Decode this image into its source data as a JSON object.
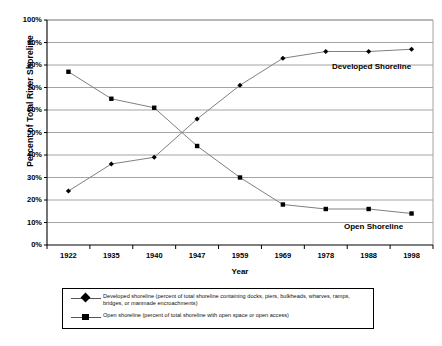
{
  "chart_data": {
    "type": "line",
    "title": "",
    "xlabel": "Year",
    "ylabel": "Percent of Total River Shoreline",
    "categories": [
      "1922",
      "1935",
      "1940",
      "1947",
      "1959",
      "1969",
      "1978",
      "1988",
      "1998"
    ],
    "ylim": [
      0,
      100
    ],
    "ytick_labels": [
      "0%",
      "10%",
      "20%",
      "30%",
      "40%",
      "50%",
      "60%",
      "70%",
      "80%",
      "90%",
      "100%"
    ],
    "ytick_values": [
      0,
      10,
      20,
      30,
      40,
      50,
      60,
      70,
      80,
      90,
      100
    ],
    "grid": "horizontal",
    "legend_position": "bottom",
    "series": [
      {
        "name": "Developed shoreline (percent of total shoreline containing docks, piers, bulkheads, wharves, ramps, bridges, or manmade encroachments)",
        "short_name": "Developed Shoreline",
        "marker": "diamond",
        "color": "#000000",
        "line_color": "#808080",
        "values": [
          24,
          36,
          39,
          56,
          71,
          83,
          86,
          86,
          87
        ]
      },
      {
        "name": "Open shoreline (percent of total shoreline with open space or open access)",
        "short_name": "Open Shoreline",
        "marker": "square",
        "color": "#000000",
        "line_color": "#808080",
        "values": [
          77,
          65,
          61,
          44,
          30,
          18,
          16,
          16,
          14
        ]
      }
    ],
    "annotations": [
      {
        "text": "Developed Shoreline",
        "x": "1978",
        "y": 83
      },
      {
        "text": "Open Shoreline",
        "x": "1988",
        "y": 11
      }
    ]
  },
  "legend": {
    "entries": [
      {
        "key_icon": "diamond-marker-icon",
        "line_1": "Developed shoreline (percent of total shoreline containing docks, piers, bulkheads, wharves, ramps,",
        "line_2": "bridges, or manmade encroachments)"
      },
      {
        "key_icon": "square-marker-icon",
        "line_1": "Open shoreline (percent of total shoreline with open space or open access)",
        "line_2": ""
      }
    ]
  }
}
